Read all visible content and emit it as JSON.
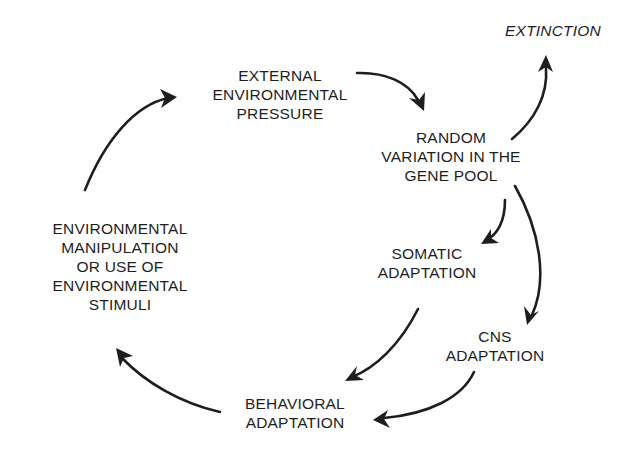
{
  "diagram": {
    "type": "cycle",
    "nodes": {
      "external_pressure": {
        "lines": [
          "EXTERNAL",
          "ENVIRONMENTAL",
          "PRESSURE"
        ]
      },
      "random_variation": {
        "lines": [
          "RANDOM",
          "VARIATION IN THE",
          "GENE POOL"
        ]
      },
      "extinction": {
        "lines": [
          "EXTINCTION"
        ]
      },
      "somatic": {
        "lines": [
          "SOMATIC",
          "ADAPTATION"
        ]
      },
      "cns": {
        "lines": [
          "CNS",
          "ADAPTATION"
        ]
      },
      "behavioral": {
        "lines": [
          "BEHAVIORAL",
          "ADAPTATION"
        ]
      },
      "environmental_manipulation": {
        "lines": [
          "ENVIRONMENTAL",
          "MANIPULATION",
          "OR USE OF",
          "ENVIRONMENTAL",
          "STIMULI"
        ]
      }
    },
    "edges": [
      {
        "from": "external_pressure",
        "to": "random_variation"
      },
      {
        "from": "random_variation",
        "to": "extinction"
      },
      {
        "from": "random_variation",
        "to": "somatic"
      },
      {
        "from": "random_variation",
        "to": "cns"
      },
      {
        "from": "somatic",
        "to": "behavioral"
      },
      {
        "from": "cns",
        "to": "behavioral"
      },
      {
        "from": "behavioral",
        "to": "environmental_manipulation"
      },
      {
        "from": "environmental_manipulation",
        "to": "external_pressure"
      }
    ],
    "colors": {
      "ink": "#1e1e1e",
      "background": "#ffffff"
    }
  }
}
